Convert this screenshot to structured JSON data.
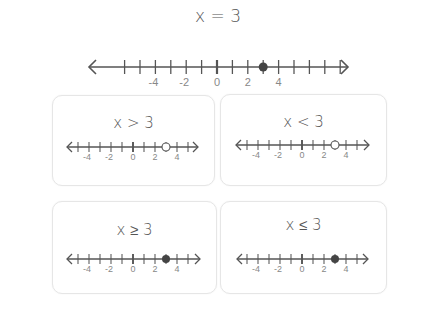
{
  "colors": {
    "line": "#555555",
    "label": "#888888",
    "title": "#555555",
    "card_border": "#e6e6e6",
    "point": "#444444"
  },
  "main": {
    "title": "x = 3",
    "relation": "equal",
    "point": 3,
    "point_style": "closed",
    "range": [
      -6,
      8
    ],
    "labels": [
      -4,
      -2,
      0,
      2,
      4
    ]
  },
  "cards": [
    {
      "title": "x > 3",
      "relation": "greater",
      "point": 3,
      "point_style": "open",
      "range": [
        -5,
        5
      ],
      "labels": [
        -4,
        -2,
        0,
        2,
        4
      ]
    },
    {
      "title": "x < 3",
      "relation": "less",
      "point": 3,
      "point_style": "open",
      "range": [
        -5,
        5
      ],
      "labels": [
        -4,
        -2,
        0,
        2,
        4
      ]
    },
    {
      "title": "x ≥ 3",
      "relation": "greater-or-equal",
      "point": 3,
      "point_style": "closed",
      "range": [
        -5,
        5
      ],
      "labels": [
        -4,
        -2,
        0,
        2,
        4
      ]
    },
    {
      "title": "x ≤ 3",
      "relation": "less-or-equal",
      "point": 3,
      "point_style": "closed",
      "range": [
        -5,
        5
      ],
      "labels": [
        -4,
        -2,
        0,
        2,
        4
      ]
    }
  ]
}
